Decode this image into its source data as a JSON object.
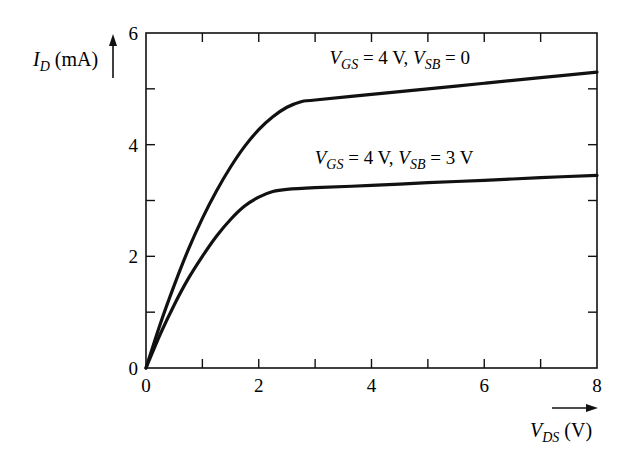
{
  "chart_data": {
    "type": "line",
    "title": "",
    "xlabel": "V_DS (V)",
    "ylabel": "I_D (mA)",
    "xlim": [
      0,
      8
    ],
    "ylim": [
      0,
      6
    ],
    "x_ticks": [
      0,
      2,
      4,
      6,
      8
    ],
    "x_minor_ticks": [
      1,
      3,
      5,
      7
    ],
    "y_ticks": [
      0,
      2,
      4,
      6
    ],
    "y_minor_ticks": [
      1,
      3,
      5
    ],
    "grid": false,
    "legend": "inline annotations",
    "series": [
      {
        "name": "V_GS = 4 V, V_SB = 0",
        "x": [
          0,
          0.25,
          0.5,
          0.75,
          1.0,
          1.25,
          1.5,
          1.75,
          2.0,
          2.25,
          2.5,
          2.75,
          3.0,
          4.0,
          5.0,
          6.0,
          7.0,
          8.0
        ],
        "values": [
          0,
          0.78,
          1.48,
          2.12,
          2.68,
          3.17,
          3.6,
          3.97,
          4.27,
          4.5,
          4.67,
          4.77,
          4.8,
          4.9,
          5.0,
          5.1,
          5.2,
          5.3
        ]
      },
      {
        "name": "V_GS = 4 V, V_SB = 3 V",
        "x": [
          0,
          0.25,
          0.5,
          0.75,
          1.0,
          1.25,
          1.5,
          1.75,
          2.0,
          2.25,
          2.5,
          3.0,
          4.0,
          5.0,
          6.0,
          7.0,
          8.0
        ],
        "values": [
          0,
          0.6,
          1.13,
          1.6,
          2.0,
          2.36,
          2.66,
          2.9,
          3.06,
          3.16,
          3.2,
          3.23,
          3.27,
          3.32,
          3.36,
          3.41,
          3.45
        ]
      }
    ],
    "annotations": [
      {
        "text_main": "V",
        "sub1": "GS",
        "mid": " = 4 V, ",
        "main2": "V",
        "sub2": "SB",
        "tail": " = 0",
        "x": 4.5,
        "y": 5.45
      },
      {
        "text_main": "V",
        "sub1": "GS",
        "mid": " = 4 V, ",
        "main2": "V",
        "sub2": "SB",
        "tail": " = 3 V",
        "x": 4.4,
        "y": 3.65
      }
    ]
  },
  "axis_labels": {
    "y_main": "I",
    "y_sub": "D",
    "y_unit": " (mA)",
    "x_main": "V",
    "x_sub": "DS",
    "x_unit": " (V)"
  },
  "colors": {
    "ink": "#111111",
    "background": "#ffffff"
  }
}
